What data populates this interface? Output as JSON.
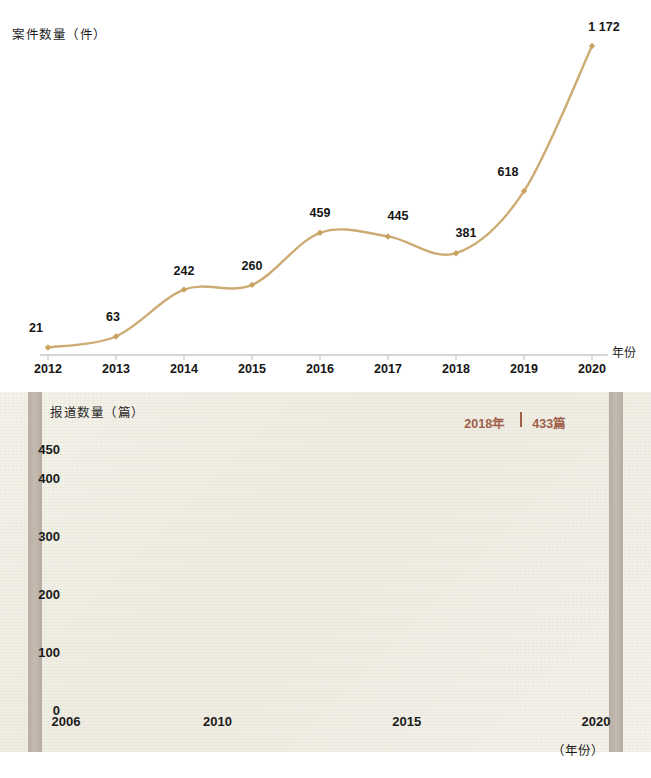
{
  "chart_data": [
    {
      "type": "line",
      "title": "",
      "ylabel": "案件数量（件）",
      "xlabel": "年份",
      "categories": [
        "2012",
        "2013",
        "2014",
        "2015",
        "2016",
        "2017",
        "2018",
        "2019",
        "2020"
      ],
      "values": [
        21,
        63,
        242,
        260,
        459,
        445,
        381,
        618,
        1172
      ],
      "value_labels": [
        "21",
        "63",
        "242",
        "260",
        "459",
        "445",
        "381",
        "618",
        "1 172"
      ],
      "xlim": [
        2012,
        2020
      ],
      "ylim": [
        0,
        1172
      ],
      "grid": false,
      "legend": "none",
      "line_color": "#cdab72",
      "marker_color": "#c9a25e",
      "axis_color": "#c9c9c9"
    },
    {
      "type": "area",
      "title": "",
      "ylabel": "报道数量（篇）",
      "xlabel": "（年份）",
      "yticks": [
        0,
        100,
        200,
        300,
        400,
        450
      ],
      "ytick_labels": [
        "0",
        "100",
        "200",
        "300",
        "400",
        "450"
      ],
      "xticks": [
        2006,
        2010,
        2015,
        2020
      ],
      "xtick_labels": [
        "2006",
        "2010",
        "2015",
        "2020"
      ],
      "xlim": [
        2006,
        2020
      ],
      "ylim": [
        0,
        450
      ],
      "grid": true,
      "legend": "none",
      "annotation": {
        "year_label": "2018年",
        "value_label": "433篇",
        "year": 2018,
        "value": 433
      },
      "area_fill": "#b7c9cf",
      "line_color": "#7d9aa4",
      "annotation_color": "#a0604a",
      "background": "#f2f0e7",
      "x": [
        2006.0,
        2006.5,
        2007.0,
        2007.5,
        2008.0,
        2008.5,
        2009.0,
        2009.5,
        2010.0,
        2010.5,
        2011.0,
        2011.5,
        2012.0,
        2012.4,
        2012.8,
        2013.2,
        2013.6,
        2014.0,
        2014.3,
        2014.7,
        2015.0,
        2015.4,
        2015.8,
        2016.2,
        2016.6,
        2017.0,
        2017.2,
        2017.5,
        2017.8,
        2018.0,
        2018.25,
        2018.5,
        2018.8,
        2019.0,
        2019.3,
        2019.6,
        2020.0
      ],
      "y": [
        15,
        6,
        3,
        5,
        8,
        11,
        14,
        17,
        20,
        23,
        26,
        29,
        33,
        42,
        62,
        80,
        88,
        89,
        76,
        54,
        49,
        50,
        52,
        55,
        58,
        62,
        75,
        150,
        300,
        433,
        380,
        270,
        195,
        172,
        158,
        150,
        147
      ]
    }
  ],
  "top_chart": {
    "y_axis_title": "案件数量（件）",
    "x_axis_unit": "年份",
    "points": [
      {
        "year": "2012",
        "label": "21"
      },
      {
        "year": "2013",
        "label": "63"
      },
      {
        "year": "2014",
        "label": "242"
      },
      {
        "year": "2015",
        "label": "260"
      },
      {
        "year": "2016",
        "label": "459"
      },
      {
        "year": "2017",
        "label": "445"
      },
      {
        "year": "2018",
        "label": "381"
      },
      {
        "year": "2019",
        "label": "618"
      },
      {
        "year": "2020",
        "label": "1 172"
      }
    ]
  },
  "bottom_chart": {
    "y_axis_title": "报道数量（篇）",
    "x_axis_unit": "（年份）",
    "y_ticks": [
      "450",
      "400",
      "300",
      "200",
      "100",
      "0"
    ],
    "x_ticks": [
      "2006",
      "2010",
      "2015",
      "2020"
    ],
    "annotation_year": "2018年",
    "annotation_value": "433篇"
  }
}
